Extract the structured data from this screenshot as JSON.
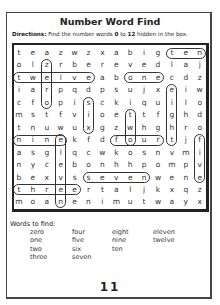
{
  "title": "Number Word Find",
  "directions": {
    "label": "Directions:",
    "text_before": " Find the number words ",
    "from": "0",
    "middle": " to ",
    "to": "12",
    "text_after": " hidden in the box."
  },
  "grid": [
    [
      "t",
      "e",
      "a",
      "z",
      "w",
      "z",
      "x",
      "a",
      "b",
      "i",
      "g",
      "t",
      "e",
      "n"
    ],
    [
      "o",
      "l",
      "z",
      "r",
      "b",
      "e",
      "r",
      "e",
      "v",
      "e",
      "d",
      "l",
      "a",
      "j"
    ],
    [
      "t",
      "w",
      "e",
      "l",
      "v",
      "e",
      "a",
      "b",
      "o",
      "n",
      "e",
      "c",
      "d",
      "z"
    ],
    [
      "i",
      "a",
      "r",
      "p",
      "q",
      "d",
      "p",
      "s",
      "u",
      "j",
      "x",
      "e",
      "i",
      "w"
    ],
    [
      "c",
      "f",
      "o",
      "p",
      "i",
      "s",
      "c",
      "k",
      "i",
      "q",
      "u",
      "i",
      "l",
      "o"
    ],
    [
      "m",
      "s",
      "t",
      "f",
      "v",
      "i",
      "o",
      "e",
      "t",
      "t",
      "f",
      "g",
      "h",
      "d"
    ],
    [
      "t",
      "n",
      "u",
      "w",
      "u",
      "x",
      "g",
      "z",
      "w",
      "h",
      "g",
      "h",
      "r",
      "o"
    ],
    [
      "n",
      "i",
      "n",
      "e",
      "k",
      "f",
      "d",
      "f",
      "o",
      "u",
      "r",
      "t",
      "j",
      "f"
    ],
    [
      "a",
      "s",
      "g",
      "l",
      "q",
      "c",
      "w",
      "k",
      "o",
      "s",
      "n",
      "v",
      "m",
      "i"
    ],
    [
      "n",
      "y",
      "c",
      "e",
      "b",
      "o",
      "n",
      "h",
      "h",
      "p",
      "o",
      "m",
      "p",
      "v"
    ],
    [
      "b",
      "e",
      "x",
      "v",
      "s",
      "s",
      "e",
      "v",
      "e",
      "n",
      "w",
      "e",
      "n",
      "e"
    ],
    [
      "t",
      "h",
      "r",
      "e",
      "e",
      "r",
      "t",
      "a",
      "l",
      "j",
      "k",
      "x",
      "q",
      "z"
    ],
    [
      "m",
      "o",
      "a",
      "n",
      "e",
      "n",
      "i",
      "m",
      "u",
      "t",
      "w",
      "a",
      "y",
      "x"
    ]
  ],
  "found_words": [
    {
      "word": "ten",
      "dir": "h",
      "row": 1,
      "start": 12,
      "end": 14
    },
    {
      "word": "zero",
      "dir": "v",
      "col": 3,
      "start": 2,
      "end": 5
    },
    {
      "word": "twelve",
      "dir": "h",
      "row": 3,
      "start": 1,
      "end": 6
    },
    {
      "word": "one",
      "dir": "h",
      "row": 3,
      "start": 9,
      "end": 11
    },
    {
      "word": "eight",
      "dir": "v",
      "col": 12,
      "start": 4,
      "end": 8
    },
    {
      "word": "six",
      "dir": "v",
      "col": 6,
      "start": 5,
      "end": 7
    },
    {
      "word": "two",
      "dir": "v",
      "col": 9,
      "start": 6,
      "end": 8
    },
    {
      "word": "nine",
      "dir": "h",
      "row": 8,
      "start": 1,
      "end": 4
    },
    {
      "word": "four",
      "dir": "h",
      "row": 8,
      "start": 8,
      "end": 11
    },
    {
      "word": "five",
      "dir": "v",
      "col": 14,
      "start": 8,
      "end": 11
    },
    {
      "word": "eleven",
      "dir": "v",
      "col": 4,
      "start": 8,
      "end": 13
    },
    {
      "word": "seven",
      "dir": "h",
      "row": 11,
      "start": 6,
      "end": 10
    },
    {
      "word": "three",
      "dir": "h",
      "row": 12,
      "start": 1,
      "end": 5
    }
  ],
  "words_to_find": {
    "label": "Words to find:",
    "columns": [
      [
        "zero",
        "one",
        "two",
        "three"
      ],
      [
        "four",
        "five",
        "six",
        "seven"
      ],
      [
        "eight",
        "nine",
        "ten"
      ],
      [
        "eleven",
        "twelve"
      ]
    ]
  },
  "page_number": "11"
}
